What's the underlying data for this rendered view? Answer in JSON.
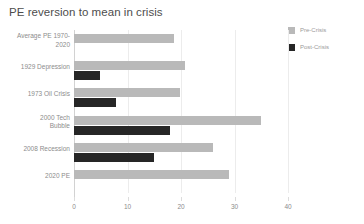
{
  "chart_data": {
    "type": "bar",
    "orientation": "horizontal",
    "title": "PE reversion to mean in crisis",
    "xlabel": "",
    "ylabel": "",
    "xlim": [
      0,
      40
    ],
    "xticks": [
      0,
      10,
      20,
      30,
      40
    ],
    "xtick_labels": [
      "0",
      "10",
      "20",
      "30",
      "40"
    ],
    "grid": true,
    "grid_axis": "x",
    "legend_position": "top-right",
    "categories": [
      "Average PE 1970-2020",
      "1929 Depression",
      "1973 Oil Crisis",
      "2000 Tech Bubble",
      "2008 Recession",
      "2020 PE"
    ],
    "category_lines": [
      [
        "Average PE 1970-",
        "2020"
      ],
      [
        "1929 Depression"
      ],
      [
        "1973 Oil Crisis"
      ],
      [
        "2000 Tech",
        "Bubble"
      ],
      [
        "2008 Recession"
      ],
      [
        "2020 PE"
      ]
    ],
    "series": [
      {
        "name": "Pre-Crisis",
        "color": "#b9b9b9",
        "values": [
          18.7,
          20.8,
          19.8,
          35.0,
          25.9,
          29.0
        ]
      },
      {
        "name": "Post-Crisis",
        "color": "#262626",
        "values": [
          null,
          4.8,
          7.8,
          18.0,
          15.0,
          null
        ]
      }
    ]
  },
  "legend": {
    "items": [
      {
        "label": "Pre-Crisis",
        "color": "#b9b9b9"
      },
      {
        "label": "Post-Crisis",
        "color": "#262626"
      }
    ]
  }
}
